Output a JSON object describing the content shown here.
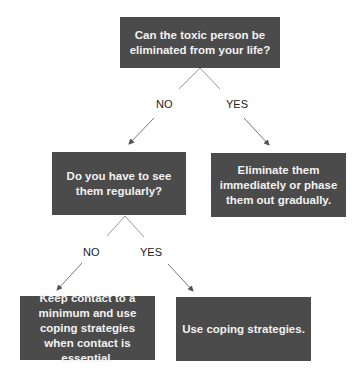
{
  "nodes": {
    "q1": {
      "text": "Can the toxic person be eliminated from your life?"
    },
    "q2": {
      "text": "Do you have to see them regularly?"
    },
    "a_yes1": {
      "text": "Eliminate them immediately or phase them out gradually."
    },
    "a_no2": {
      "text": "Keep contact to a minimum and use coping strategies when contact is essential."
    },
    "a_yes2": {
      "text": "Use coping strategies."
    }
  },
  "edges": {
    "q1_no": {
      "label": "NO"
    },
    "q1_yes": {
      "label": "YES"
    },
    "q2_no": {
      "label": "NO"
    },
    "q2_yes": {
      "label": "YES"
    }
  },
  "colors": {
    "box": "#4b4b4b",
    "box_text": "#f2f2f2",
    "line": "#888888"
  }
}
